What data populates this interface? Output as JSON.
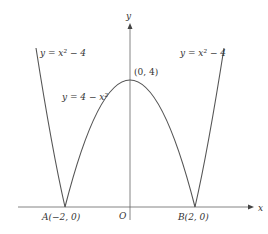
{
  "figure": {
    "x_axis_label": "x",
    "y_axis_label": "y",
    "origin_label": "O",
    "curves": [
      {
        "label": "y = 4 − x²",
        "expr": "4-x^2",
        "domain": [
          -2,
          2
        ]
      },
      {
        "label": "y = x² − 4",
        "expr": "x^2-4 (reflected, |x|>=2)",
        "domain": [
          -2.5,
          -2
        ]
      },
      {
        "label": "y = x² − 4",
        "expr": "x^2-4 (reflected, |x|>=2)",
        "domain": [
          2,
          2.5
        ]
      }
    ],
    "points": [
      {
        "name": "A",
        "label": "A(−2, 0)",
        "x": -2,
        "y": 0
      },
      {
        "name": "B",
        "label": "B(2, 0)",
        "x": 2,
        "y": 0
      },
      {
        "name": "apex",
        "label": "(0, 4)",
        "x": 0,
        "y": 4
      }
    ],
    "labels": {
      "left_curve": "y = x² − 4",
      "right_curve": "y = x² − 4",
      "middle_curve": "y = 4 − x²",
      "apex": "(0, 4)",
      "point_a": "A(−2, 0)",
      "point_b": "B(2, 0)"
    },
    "colors": {
      "curve": "#555555",
      "axis": "#666666",
      "text": "#333333"
    }
  }
}
